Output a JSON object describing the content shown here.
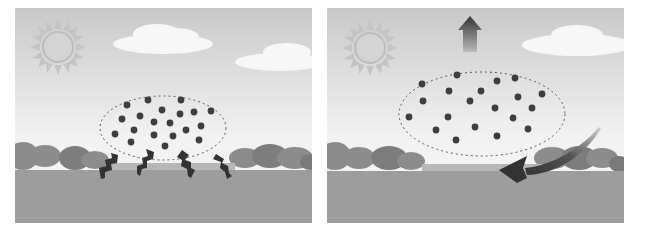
{
  "figure": {
    "panels": [
      {
        "id": "left",
        "scene": "sun-heating-ground",
        "elements": [
          "sun-icon",
          "cloud",
          "cloud",
          "dashed-air-parcel",
          "air-molecules",
          "heat-wave-arrows",
          "trees",
          "ground"
        ],
        "molecule_count": 22,
        "heat_arrow_count": 4
      },
      {
        "id": "right",
        "scene": "warm-air-rising",
        "elements": [
          "sun-icon",
          "cloud",
          "up-arrow",
          "dashed-air-parcel",
          "air-molecules",
          "curved-return-arrow",
          "trees",
          "ground"
        ],
        "molecule_count": 22
      }
    ],
    "colors": {
      "sky_top": "#c9c9c9",
      "sky_bottom": "#f4f4f4",
      "sun": "#c6c6c6",
      "trees": "#8a8a8a",
      "ground": "#9a9a9a",
      "molecule": "#3f3f3f",
      "arrow": "#3a3a3a"
    }
  }
}
